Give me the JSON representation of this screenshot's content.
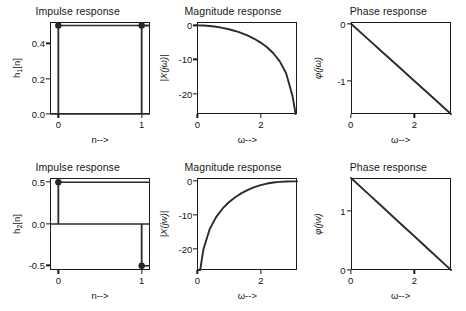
{
  "figure": {
    "rows": 2,
    "cols": 3,
    "background": "#ffffff",
    "line_color": "#2b2b2b",
    "axis_color": "#1a1a1a"
  },
  "panels": [
    {
      "id": "impulse-1",
      "title": "Impulse response",
      "ylabel": "h₁[n]",
      "ylabel_base": "h",
      "ylabel_sub": "1",
      "ylabel_rest": "[n]",
      "xlabel": "n-->",
      "yticks": [
        "0.0",
        "0.2",
        "0.4"
      ],
      "ytick_values": [
        0.0,
        0.2,
        0.4
      ],
      "xticks": [
        "0",
        "1"
      ],
      "xtick_values": [
        0,
        1
      ]
    },
    {
      "id": "magnitude-1",
      "title": "Magnitude response",
      "ylabel": "|X(jω)|",
      "xlabel": "ω-->",
      "yticks": [
        "0",
        "-10",
        "-20"
      ],
      "ytick_values": [
        0,
        -10,
        -20
      ],
      "xticks": [
        "0",
        "2"
      ],
      "xtick_values": [
        0,
        2
      ]
    },
    {
      "id": "phase-1",
      "title": "Phase response",
      "ylabel": "φ(jω)",
      "xlabel": "ω-->",
      "yticks": [
        "0",
        "-1"
      ],
      "ytick_values": [
        0,
        -1
      ],
      "xticks": [
        "0",
        "2"
      ],
      "xtick_values": [
        0,
        2
      ]
    },
    {
      "id": "impulse-2",
      "title": "Impulse response",
      "ylabel": "h₂[n]",
      "ylabel_base": "h",
      "ylabel_sub": "2",
      "ylabel_rest": "[n]",
      "xlabel": "n-->",
      "yticks": [
        "0.5",
        "0.0",
        "-0.5"
      ],
      "ytick_values": [
        0.5,
        0.0,
        -0.5
      ],
      "xticks": [
        "0",
        "1"
      ],
      "xtick_values": [
        0,
        1
      ]
    },
    {
      "id": "magnitude-2",
      "title": "Magnitude response",
      "ylabel": "|X(jw)|",
      "xlabel": "ω-->",
      "yticks": [
        "0",
        "-10",
        "-20"
      ],
      "ytick_values": [
        0,
        -10,
        -20
      ],
      "xticks": [
        "0",
        "2"
      ],
      "xtick_values": [
        0,
        2
      ]
    },
    {
      "id": "phase-2",
      "title": "Phase response",
      "ylabel": "φ(jw)",
      "xlabel": "ω-->",
      "yticks": [
        "1",
        "0"
      ],
      "ytick_values": [
        1,
        0
      ],
      "xticks": [
        "0",
        "2"
      ],
      "xtick_values": [
        0,
        2
      ]
    }
  ],
  "chart_data": [
    {
      "type": "line",
      "subtype": "stem",
      "panel": "impulse-1",
      "title": "Impulse response",
      "xlabel": "n-->",
      "ylabel": "h1[n]",
      "x": [
        0,
        1
      ],
      "values": [
        0.5,
        0.5
      ],
      "xlim": [
        -0.1,
        1.1
      ],
      "ylim": [
        0.0,
        0.52
      ],
      "markers": "filled-circle",
      "baseline": 0.0,
      "grid": false,
      "legend": null
    },
    {
      "type": "line",
      "panel": "magnitude-1",
      "title": "Magnitude response",
      "xlabel": "omega-->",
      "ylabel": "|X(jw)| (dB)",
      "description": "20*log10|cos(w/2)| lowpass averaging filter",
      "x": [
        0.0,
        0.2,
        0.4,
        0.6,
        0.8,
        1.0,
        1.2,
        1.4,
        1.6,
        1.8,
        2.0,
        2.2,
        2.4,
        2.6,
        2.8,
        3.0,
        3.1
      ],
      "values": [
        0.0,
        -0.04,
        -0.17,
        -0.4,
        -0.71,
        -1.12,
        -1.63,
        -2.26,
        -3.01,
        -3.93,
        -5.04,
        -6.42,
        -8.18,
        -10.55,
        -14.06,
        -20.7,
        -26.0
      ],
      "xlim": [
        0,
        3.14159
      ],
      "ylim": [
        -26,
        1
      ],
      "grid": false,
      "legend": null
    },
    {
      "type": "line",
      "panel": "phase-1",
      "title": "Phase response",
      "xlabel": "omega-->",
      "ylabel": "phi(jw)",
      "description": "linear phase -w/2, lowpass averaging filter",
      "x": [
        0.0,
        0.5,
        1.0,
        1.5,
        2.0,
        2.5,
        3.0,
        3.14159
      ],
      "values": [
        0.0,
        -0.25,
        -0.5,
        -0.75,
        -1.0,
        -1.25,
        -1.5,
        -1.5708
      ],
      "xlim": [
        0,
        3.14159
      ],
      "ylim": [
        -1.5708,
        0.03
      ],
      "grid": false,
      "legend": null
    },
    {
      "type": "line",
      "subtype": "stem",
      "panel": "impulse-2",
      "title": "Impulse response",
      "xlabel": "n-->",
      "ylabel": "h2[n]",
      "x": [
        0,
        1
      ],
      "values": [
        0.5,
        -0.5
      ],
      "xlim": [
        -0.1,
        1.1
      ],
      "ylim": [
        -0.55,
        0.55
      ],
      "markers": "filled-circle",
      "baseline": 0.0,
      "grid": false,
      "legend": null
    },
    {
      "type": "line",
      "panel": "magnitude-2",
      "title": "Magnitude response",
      "xlabel": "omega-->",
      "ylabel": "|X(jw)| (dB)",
      "description": "20*log10|sin(w/2)| highpass differencing filter",
      "x": [
        0.02,
        0.1,
        0.2,
        0.4,
        0.6,
        0.8,
        1.0,
        1.2,
        1.4,
        1.6,
        1.8,
        2.0,
        2.2,
        2.4,
        2.6,
        2.8,
        3.0,
        3.14159
      ],
      "values": [
        -40.0,
        -26.0,
        -20.0,
        -13.98,
        -10.48,
        -8.01,
        -6.13,
        -4.64,
        -3.44,
        -2.47,
        -1.69,
        -1.08,
        -0.63,
        -0.32,
        -0.13,
        -0.03,
        0.0,
        0.0
      ],
      "xlim": [
        0,
        3.14159
      ],
      "ylim": [
        -26,
        1
      ],
      "grid": false,
      "legend": null
    },
    {
      "type": "line",
      "panel": "phase-2",
      "title": "Phase response",
      "xlabel": "omega-->",
      "ylabel": "phi(jw)",
      "description": "linear phase pi/2 - w/2, highpass differencing filter",
      "x": [
        0.0,
        0.5,
        1.0,
        1.5,
        2.0,
        2.5,
        3.0,
        3.14159
      ],
      "values": [
        1.5708,
        1.3208,
        1.0708,
        0.8208,
        0.5708,
        0.3208,
        0.0708,
        0.0
      ],
      "xlim": [
        0,
        3.14159
      ],
      "ylim": [
        0,
        1.5708
      ],
      "grid": false,
      "legend": null
    }
  ]
}
